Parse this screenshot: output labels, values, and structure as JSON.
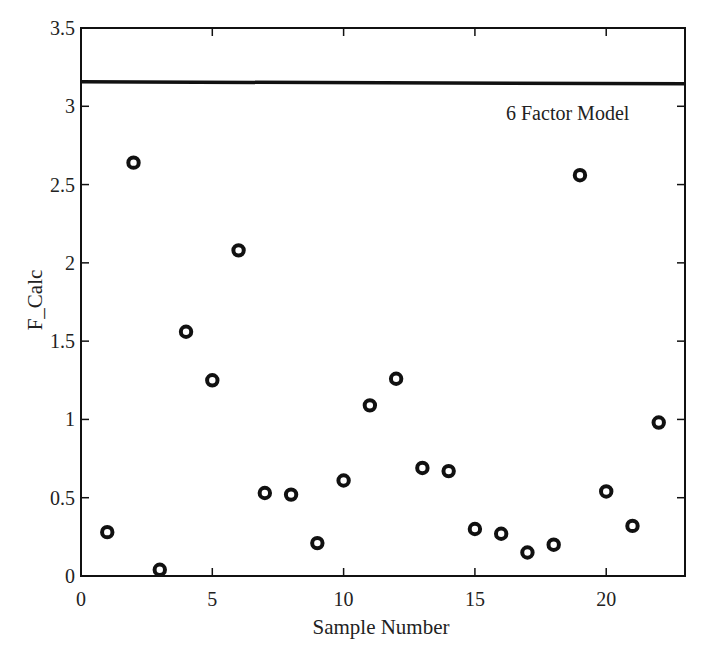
{
  "chart_data": {
    "type": "scatter",
    "title": "",
    "xlabel": "Sample Number",
    "ylabel": "F_Calc",
    "xlim": [
      0,
      23
    ],
    "ylim": [
      0,
      3.5
    ],
    "xticks": [
      0,
      5,
      10,
      15,
      20
    ],
    "xtick_labels": [
      "0",
      "5",
      "10",
      "15",
      "20"
    ],
    "yticks": [
      0,
      0.5,
      1,
      1.5,
      2,
      2.5,
      3,
      3.5
    ],
    "ytick_labels": [
      "0",
      "0.5",
      "1",
      "1.5",
      "2",
      "2.5",
      "3",
      "3.5"
    ],
    "grid": false,
    "legend": null,
    "marker": "o",
    "marker_color": "#111111",
    "x": [
      1,
      2,
      3,
      4,
      5,
      6,
      7,
      8,
      9,
      10,
      11,
      12,
      13,
      14,
      15,
      16,
      17,
      18,
      19,
      20,
      21,
      22
    ],
    "y": [
      0.28,
      2.64,
      0.04,
      1.56,
      1.25,
      2.08,
      0.53,
      0.52,
      0.21,
      0.61,
      1.09,
      1.26,
      0.69,
      0.67,
      0.3,
      0.27,
      0.15,
      0.2,
      2.56,
      0.54,
      0.32,
      0.98
    ],
    "reference_line": {
      "type": "horizontal",
      "y": 3.15,
      "label": "6 Factor Model",
      "color": "#111111"
    },
    "annotations": [
      {
        "text": "6 Factor Model",
        "x": 19.5,
        "y": 2.95
      }
    ]
  }
}
